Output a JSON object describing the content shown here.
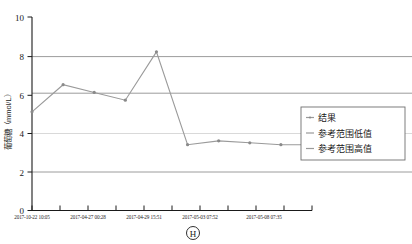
{
  "chart_data": {
    "type": "line",
    "title": "",
    "xlabel": "",
    "ylabel": "葡萄糖（mmol/L）",
    "ylim": [
      0,
      10
    ],
    "yticks": [
      0,
      2,
      4,
      6,
      8,
      10
    ],
    "ytick_labels": [
      "0",
      "2",
      "4",
      "6",
      "8",
      "10"
    ],
    "grid": true,
    "legend_position": "right",
    "x_tick_labels": [
      "2017-10-22 10:05",
      "2017-04-27 00:28",
      "2017-04-29 15:51",
      "2017-05-03 07:52",
      "2017-05-08 07:35"
    ],
    "series": [
      {
        "name": "结果",
        "color": "#9a9a9a",
        "marker": "circle",
        "values": [
          5.1,
          6.5,
          6.1,
          5.7,
          8.2,
          3.4,
          3.6,
          3.5,
          3.4,
          3.4
        ]
      },
      {
        "name": "参考范围低值",
        "color": "#8c8c8c",
        "style": "horizontal-reference",
        "value": 6.1
      },
      {
        "name": "参考范围高值",
        "color": "#8c8c8c",
        "style": "horizontal-reference",
        "value": 8.0
      }
    ],
    "annotation": "H"
  },
  "legend": {
    "items": [
      {
        "label": "结果"
      },
      {
        "label": "参考范围低值"
      },
      {
        "label": "参考范围高值"
      }
    ]
  },
  "axis": {
    "y_label": "葡萄糖（mmol/L）",
    "y_ticks": [
      "10",
      "8",
      "6",
      "4",
      "2",
      "0"
    ],
    "x_labels": [
      "2017-10-22 10:05",
      "2017-04-27 00:28",
      "2017-04-29 15:51",
      "2017-05-03 07:52",
      "2017-05-08 07:35"
    ]
  },
  "footer": {
    "marker": "H"
  }
}
